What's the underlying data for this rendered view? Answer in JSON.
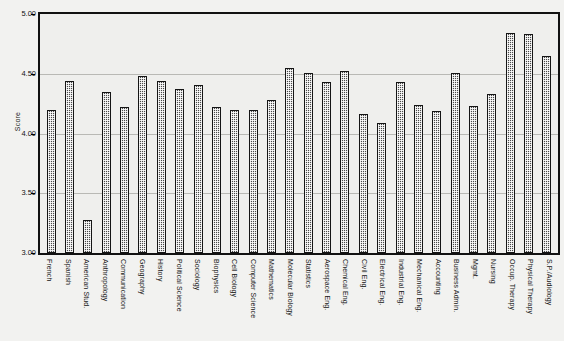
{
  "chart_data": {
    "type": "bar",
    "title": "",
    "xlabel": "",
    "ylabel": "Score",
    "ylim": [
      3.0,
      5.0
    ],
    "yticks": [
      "3.00",
      "3.50",
      "4.00",
      "4.50",
      "5.00"
    ],
    "ytick_values": [
      3.0,
      3.5,
      4.0,
      4.5,
      5.0
    ],
    "grid": true,
    "legend": "none",
    "bar_color": "#4a4a4a",
    "bar_pattern": "cross-hatch",
    "categories": [
      "French",
      "Spanish",
      "American Stud.",
      "Anthropology",
      "Communication",
      "Geography",
      "History",
      "Political Science",
      "Sociology",
      "Biophysics",
      "Cell Biology",
      "Computer Science",
      "Mathematics",
      "Molecular Biology",
      "Statistics",
      "Aerospace Eng.",
      "Chemical Eng.",
      "Civil Eng.",
      "Electrical Eng.",
      "Industrial Eng.",
      "Mechanical Eng.",
      "Accounting",
      "Business Admin.",
      "Mgmt.",
      "Nursing",
      "Occup. Therapy",
      "Physical Therapy",
      "S.P./Audiology"
    ],
    "values": [
      4.2,
      4.44,
      3.28,
      4.35,
      4.22,
      4.48,
      4.44,
      4.37,
      4.41,
      4.22,
      4.2,
      4.2,
      4.28,
      4.55,
      4.51,
      4.43,
      4.52,
      4.16,
      4.09,
      4.43,
      4.24,
      4.19,
      4.51,
      4.23,
      4.33,
      4.84,
      4.83,
      4.65
    ]
  }
}
